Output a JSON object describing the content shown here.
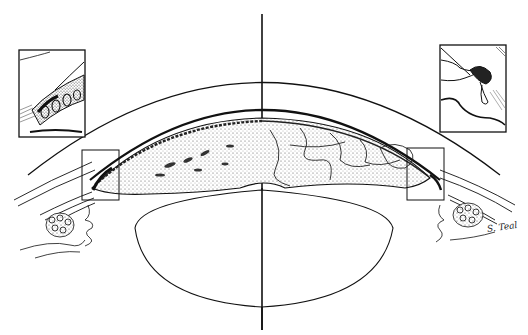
{
  "figure": {
    "style": "black-and-white pen-and-ink medical illustration",
    "colors": {
      "ink": "#111111",
      "stipple": "#555555",
      "background": "#ffffff"
    },
    "signature": "S. Teal",
    "elements": [
      {
        "name": "optical-axis",
        "description": "vertical center line"
      },
      {
        "name": "cornea",
        "description": "outer arc"
      },
      {
        "name": "iris-cross-section",
        "description": "stippled, left half with pigment crypts, right half with vessel-like pattern"
      },
      {
        "name": "lens",
        "description": "oval below the iris"
      },
      {
        "name": "left-angle-box",
        "description": "rectangle marking left iridocorneal angle"
      },
      {
        "name": "right-angle-box",
        "description": "rectangle marking right iridocorneal angle"
      },
      {
        "name": "left-inset",
        "description": "magnified detail of left angle, top-left"
      },
      {
        "name": "right-inset",
        "description": "magnified detail of right angle, top-right"
      },
      {
        "name": "ciliary-body-left",
        "description": "ciliary processes and stroma, lower left"
      },
      {
        "name": "ciliary-body-right",
        "description": "ciliary processes and stroma, lower right"
      }
    ]
  }
}
